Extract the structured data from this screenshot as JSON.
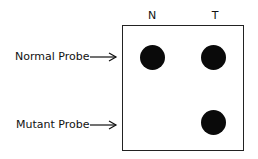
{
  "figure": {
    "columns": [
      {
        "label": "N"
      },
      {
        "label": "T"
      }
    ],
    "rows": [
      {
        "label": "Normal Probe"
      },
      {
        "label": "Mutant Probe"
      }
    ],
    "spots": [
      {
        "row": "Normal Probe",
        "column": "N",
        "present": true
      },
      {
        "row": "Normal Probe",
        "column": "T",
        "present": true
      },
      {
        "row": "Mutant Probe",
        "column": "N",
        "present": false
      },
      {
        "row": "Mutant Probe",
        "column": "T",
        "present": true
      }
    ]
  }
}
